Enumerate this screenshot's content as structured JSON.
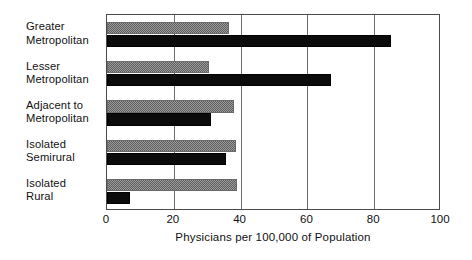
{
  "chart_data": {
    "type": "bar",
    "orientation": "horizontal",
    "title": "",
    "xlabel": "Physicians per 100,000 of Population",
    "ylabel": "",
    "xlim": [
      0,
      100
    ],
    "xticks": [
      "0",
      "20",
      "40",
      "60",
      "80",
      "100"
    ],
    "xtick_values": [
      0,
      20,
      40,
      60,
      80,
      100
    ],
    "grid": true,
    "legend": "none",
    "categories": [
      "Greater\nMetropolitan",
      "Lesser\nMetropolitan",
      "Adjacent to\nMetropolitan",
      "Isolated\nSemirural",
      "Isolated\nRural"
    ],
    "series": [
      {
        "name": "series-gray",
        "color": "#9a9a9a",
        "pattern": "checker-dither",
        "values": [
          36.5,
          30.5,
          38.0,
          38.5,
          39.0
        ]
      },
      {
        "name": "series-black",
        "color": "#0b0b0b",
        "pattern": "solid",
        "values": [
          85.0,
          67.0,
          31.0,
          35.5,
          7.0
        ]
      }
    ]
  }
}
